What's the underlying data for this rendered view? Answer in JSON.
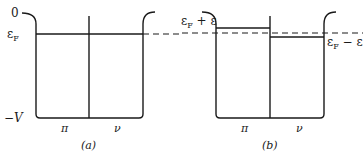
{
  "figure": {
    "panel_a": {
      "caption": "(a)",
      "axis_labels": {
        "zero": "0",
        "fermi": "ε",
        "fermi_sub": "F",
        "bottom": "−V"
      },
      "region_labels": {
        "left": "π",
        "right": "ν"
      }
    },
    "panel_b": {
      "caption": "(b)",
      "level_labels": {
        "upper": "ε",
        "upper_sub": "F",
        "upper_suffix": " + ε",
        "lower": "ε",
        "lower_sub": "F",
        "lower_suffix": " − ε"
      },
      "region_labels": {
        "left": "π",
        "right": "ν"
      }
    }
  }
}
